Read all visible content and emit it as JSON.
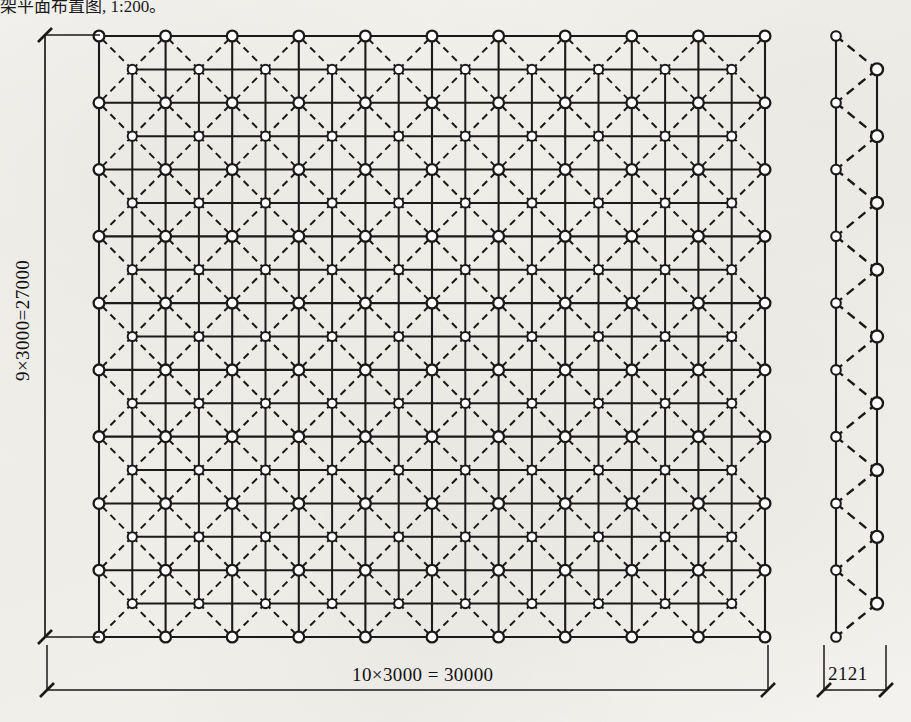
{
  "caption": {
    "text": "架平面布置图,  1:200。"
  },
  "drawing": {
    "title": "space-frame-plan",
    "line_color": "#1a1a1a",
    "node_fill": "#ffffff",
    "background": "#f2f1ed"
  },
  "dimensions": {
    "bottom": {
      "label": "10×3000 = 30000",
      "bays": 10,
      "module": 3000,
      "total": 30000
    },
    "left": {
      "label": "9×3000=27000",
      "bays": 9,
      "module": 3000,
      "total": 27000
    },
    "side": {
      "label": "2121",
      "value": 2121
    }
  },
  "chart_data": {
    "type": "diagram",
    "plan": {
      "columns": 11,
      "rows": 10,
      "x_bays": 10,
      "y_bays": 9,
      "module_mm": 3000,
      "width_mm": 30000,
      "height_mm": 27000,
      "top_chord_style": "solid",
      "bottom_chord_style": "solid",
      "web_member_style": "dashed",
      "top_nodes": 110,
      "bottom_nodes": 90
    },
    "elevation": {
      "depth_mm": 2121,
      "top_nodes": 10,
      "bottom_nodes": 9,
      "chord_style": "solid",
      "web_style": "dashed"
    }
  }
}
